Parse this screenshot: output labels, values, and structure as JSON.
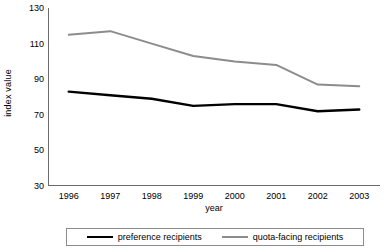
{
  "chart_data": {
    "type": "line",
    "title": "",
    "xlabel": "year",
    "ylabel": "index value",
    "categories": [
      "1996",
      "1997",
      "1998",
      "1999",
      "2000",
      "2001",
      "2002",
      "2003"
    ],
    "ylim": [
      30,
      130
    ],
    "yticks": [
      130,
      110,
      90,
      70,
      50,
      30
    ],
    "grid": false,
    "legend_position": "bottom",
    "series": [
      {
        "name": "preference recipients",
        "color": "#000000",
        "width": 2.4,
        "values": [
          83,
          81,
          79,
          75,
          76,
          76,
          72,
          73
        ]
      },
      {
        "name": "quota-facing recipients",
        "color": "#8c8c8c",
        "width": 2,
        "values": [
          115,
          117,
          110,
          103,
          100,
          98,
          87,
          86
        ]
      }
    ]
  },
  "axis": {
    "line_color": "#6b6b6b"
  }
}
